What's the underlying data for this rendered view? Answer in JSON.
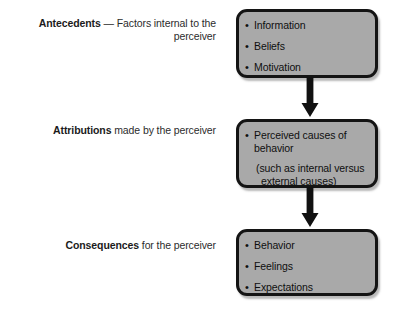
{
  "diagram": {
    "box_fill_color": "#a9a9a9",
    "box_border_color": "#141414",
    "arrow_color": "#111111",
    "background_color": "#ffffff",
    "rows": [
      {
        "label_lead": "Antecedents",
        "label_rest": " — Factors internal to the perceiver",
        "items": [
          "Information",
          "Beliefs",
          "Motivation"
        ],
        "note_line1": "",
        "note_line2": ""
      },
      {
        "label_lead": "Attributions",
        "label_rest": " made by the perceiver",
        "items": [
          "Perceived causes of behavior"
        ],
        "note_line1": "(such as internal versus",
        "note_line2": "external causes)"
      },
      {
        "label_lead": "Consequences",
        "label_rest": " for the perceiver",
        "items": [
          "Behavior",
          "Feelings",
          "Expectations"
        ],
        "note_line1": "",
        "note_line2": ""
      }
    ],
    "bullet_glyph": "•",
    "connectors": [
      {
        "from": "antecedents-box",
        "to": "attributions-box",
        "direction": "down"
      },
      {
        "from": "attributions-box",
        "to": "consequences-box",
        "direction": "down"
      }
    ]
  }
}
